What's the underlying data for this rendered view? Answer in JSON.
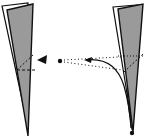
{
  "diagram": {
    "type": "line-art illustration",
    "colors": {
      "fill": "#9a9a9a",
      "stroke": "#111111",
      "background": "#ffffff"
    },
    "elements": {
      "left_flap": "tapered paper strip, folded edge on left",
      "left_fold_line": "dashed diagonal fold line",
      "arrow_head": "black wedge pointer",
      "pivot_dot": "start dot",
      "motion_path": "dotted guide lines with curved arrow",
      "right_flap": "tapered paper strip after fold",
      "right_fold_line": "dashed diagonal fold line",
      "end_dot": "bottom tip dot"
    }
  }
}
